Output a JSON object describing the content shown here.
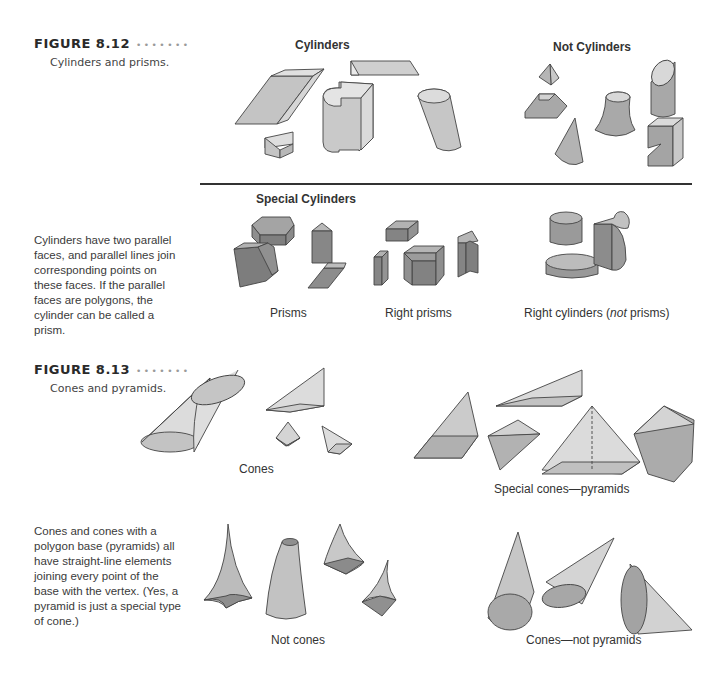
{
  "figures": [
    {
      "number": "FIGURE 8.12",
      "dots": "•••••••",
      "caption": "Cylinders and prisms.",
      "sections": {
        "top_left_heading": "Cylinders",
        "top_right_heading": "Not Cylinders",
        "bottom_heading": "Special Cylinders"
      },
      "labels": {
        "prisms": "Prisms",
        "right_prisms": "Right prisms",
        "right_cylinders_pre": "Right cylinders (",
        "right_cylinders_em": "not",
        "right_cylinders_post": " prisms)"
      },
      "sidebar_text": "Cylinders have two parallel faces, and parallel lines join corresponding points on these faces. If the parallel faces are polygons, the cylinder can be called a prism."
    },
    {
      "number": "FIGURE 8.13",
      "dots": "•••••••",
      "caption": "Cones and pyramids.",
      "labels": {
        "cones": "Cones",
        "special_cones": "Special cones—pyramids",
        "not_cones": "Not cones",
        "cones_not_pyramids": "Cones—not pyramids"
      },
      "sidebar_text": "Cones and cones with a polygon base (pyramids) all have straight-line elements joining every point of the base with the vertex. (Yes, a pyramid is just a special type of cone.)"
    }
  ],
  "colors": {
    "light_fill": "#d9d9d9",
    "mid_fill": "#b8b8b8",
    "dark_fill": "#8f8f8f",
    "rule": "#333333"
  }
}
